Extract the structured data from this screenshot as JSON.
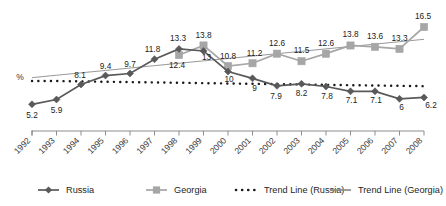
{
  "chart_data": {
    "type": "line",
    "title": "",
    "subtitle": "",
    "xlabel": "",
    "ylabel": "%",
    "grid": false,
    "legend_position": "bottom",
    "ylim": [
      0,
      18
    ],
    "xlim_categories_count": 17,
    "categories": [
      "1992",
      "1993",
      "1994",
      "1995",
      "1996",
      "1997",
      "1998",
      "1999",
      "2000",
      "2001",
      "2002",
      "2003",
      "2004",
      "2005",
      "2006",
      "2007",
      "2008"
    ],
    "series": [
      {
        "name": "Russia",
        "marker": "diamond",
        "color": "#595959",
        "values": [
          5.2,
          5.9,
          8.1,
          9.4,
          9.7,
          11.8,
          13.3,
          13,
          10,
          9,
          7.9,
          8.2,
          7.8,
          7.1,
          7.1,
          6,
          6.2
        ],
        "labels": [
          "5.2",
          "5.9",
          "8.1",
          "9.4",
          "9.7",
          "11.8",
          "13.3",
          "13",
          "10",
          "9",
          "7.9",
          "8.2",
          "7.8",
          "7.1",
          "7.1",
          "6",
          "6.2"
        ]
      },
      {
        "name": "Georgia",
        "marker": "square",
        "color": "#a6a6a6",
        "values": [
          null,
          null,
          null,
          null,
          null,
          null,
          12.4,
          13.8,
          10.8,
          11.2,
          12.6,
          11.5,
          12.6,
          13.8,
          13.6,
          13.3,
          16.5
        ],
        "labels": [
          "",
          "",
          "",
          "",
          "",
          "",
          "12.4",
          "13.8",
          "10.8",
          "11.2",
          "12.6",
          "11.5",
          "12.6",
          "13.8",
          "13.6",
          "13.3",
          "16.5"
        ]
      },
      {
        "name": "Trend Line (Russia)",
        "marker": "none",
        "style": "dotted",
        "color": "#1a1a1a",
        "values": [
          8.6,
          8.6,
          8.55,
          8.5,
          8.45,
          8.4,
          8.35,
          8.3,
          8.25,
          8.2,
          8.15,
          8.1,
          8.05,
          8.0,
          7.95,
          7.9,
          7.85
        ]
      },
      {
        "name": "Trend Line (Georgia)",
        "marker": "none",
        "style": "solid",
        "color": "#8c8c8c",
        "values": [
          9.1,
          9.45,
          9.8,
          10.15,
          10.5,
          10.85,
          11.2,
          11.55,
          11.9,
          12.25,
          12.6,
          12.95,
          13.3,
          13.65,
          14.0,
          14.35,
          14.7
        ]
      }
    ],
    "legend": [
      {
        "label": "Russia",
        "marker": "diamond",
        "color": "#595959",
        "style": "solid"
      },
      {
        "label": "Georgia",
        "marker": "square",
        "color": "#a6a6a6",
        "style": "solid"
      },
      {
        "label": "Trend Line (Russia)",
        "marker": "none",
        "color": "#1a1a1a",
        "style": "dotted"
      },
      {
        "label": "Trend Line (Georgia)",
        "marker": "none",
        "color": "#8c8c8c",
        "style": "solid"
      }
    ]
  },
  "axis": {
    "y_axis_label": "%",
    "tick_labels": [
      "1992",
      "1993",
      "1994",
      "1995",
      "1996",
      "1997",
      "1998",
      "1999",
      "2000",
      "2001",
      "2002",
      "2003",
      "2004",
      "2005",
      "2006",
      "2007",
      "2008"
    ]
  },
  "legend": {
    "items": [
      {
        "label": "Russia"
      },
      {
        "label": "Georgia"
      },
      {
        "label": "Trend Line (Russia)"
      },
      {
        "label": "Trend Line (Georgia)"
      }
    ]
  },
  "labels": {
    "russia": [
      "5.2",
      "5.9",
      "8.1",
      "9.4",
      "9.7",
      "11.8",
      "13.3",
      "13",
      "10",
      "9",
      "7.9",
      "8.2",
      "7.8",
      "7.1",
      "7.1",
      "6",
      "6.2"
    ],
    "georgia": [
      "12.4",
      "13.8",
      "10.8",
      "11.2",
      "12.6",
      "11.5",
      "12.6",
      "13.8",
      "13.6",
      "13.3",
      "16.5"
    ]
  }
}
